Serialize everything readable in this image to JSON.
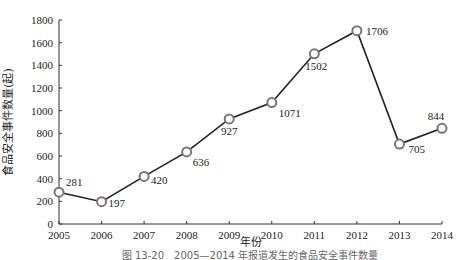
{
  "chart_data": {
    "type": "line",
    "title": "",
    "caption": "图 13-20　2005—2014 年报道发生的食品安全事件数量",
    "xlabel": "年份",
    "ylabel": "食品安全事件数量(起)",
    "categories": [
      "2005",
      "2006",
      "2007",
      "2008",
      "2009",
      "2010",
      "2011",
      "2012",
      "2013",
      "2014"
    ],
    "series": [
      {
        "name": "食品安全事件数量",
        "values": [
          281,
          197,
          420,
          636,
          927,
          1071,
          1502,
          1706,
          705,
          844
        ]
      }
    ],
    "data_labels": [
      "281",
      "197",
      "420",
      "636",
      "927",
      "1071",
      "1502",
      "1706",
      "705",
      "844"
    ],
    "yticks": [
      "0",
      "200",
      "400",
      "600",
      "800",
      "1000",
      "1200",
      "1400",
      "1600",
      "1800"
    ],
    "ylim": [
      0,
      1800
    ],
    "grid": false,
    "legend": "none",
    "colors": {
      "line": "#222222",
      "marker": "#777777"
    }
  }
}
